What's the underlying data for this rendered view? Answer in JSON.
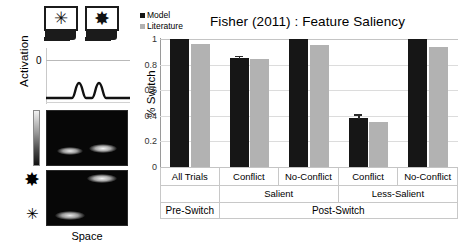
{
  "left_panel": {
    "activation_axis_label": "Activation",
    "activation_zero_tick": "0",
    "space_label": "Space",
    "stimulus_icons": [
      {
        "name": "monitor-thin-star",
        "glyph": "✳"
      },
      {
        "name": "monitor-bold-asterisk",
        "glyph": "✸"
      }
    ],
    "row_icons": [
      {
        "name": "bold-asterisk-icon",
        "glyph": "✸"
      },
      {
        "name": "thin-star-icon",
        "glyph": "✳"
      }
    ],
    "colorbar_name": "activation-colorbar"
  },
  "chart_data": {
    "type": "bar",
    "title": "Fisher (2011)  : Feature Saliency",
    "xlabel": "",
    "ylabel": "% Switch",
    "ylim": [
      0,
      1
    ],
    "yticks": [
      "0",
      "0.2",
      "0.4",
      "0.6",
      "0.8",
      "1"
    ],
    "ytick_values": [
      0,
      0.2,
      0.4,
      0.6,
      0.8,
      1
    ],
    "grid": false,
    "legend_position": "top-left",
    "categories": [
      "All Trials",
      "Conflict",
      "No-Conflict",
      "Conflict",
      "No-Conflict"
    ],
    "group_mid_labels": [
      {
        "label": "",
        "span": 1
      },
      {
        "label": "Salient",
        "span": 2
      },
      {
        "label": "Less-Salient",
        "span": 2
      }
    ],
    "group_top_labels": [
      {
        "label": "Pre-Switch",
        "span": 1
      },
      {
        "label": "Post-Switch",
        "span": 4
      }
    ],
    "series": [
      {
        "name": "Model",
        "color": "#161616",
        "values": [
          1.0,
          0.85,
          1.0,
          0.38,
          1.0
        ],
        "errors": [
          0,
          0.015,
          0,
          0.03,
          0
        ]
      },
      {
        "name": "Literature",
        "color": "#b2b2b2",
        "values": [
          0.96,
          0.845,
          0.955,
          0.355,
          0.94
        ],
        "errors": [
          0,
          0,
          0,
          0,
          0
        ]
      }
    ]
  }
}
